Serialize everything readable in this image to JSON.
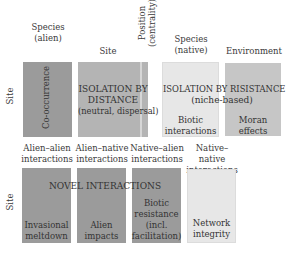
{
  "top_headers": {
    "species_alien": [
      "Species",
      "(alien)"
    ],
    "site": "Site",
    "position": [
      "Position",
      "(centrality)"
    ],
    "species_native": [
      "Species",
      "(native)"
    ],
    "environment": "Environment"
  },
  "row_labels": {
    "top": "Site",
    "bottom": "Site"
  },
  "top_row": {
    "cooccurrence": "Co-occurrence",
    "isolation_distance": [
      "ISOLATION BY",
      "DISTANCE",
      "(neutral, dispersal)"
    ],
    "isolation_resistance": [
      "ISOLATION BY RISISTANCE",
      "(niche-based)"
    ],
    "biotic_interactions": [
      "Biotic",
      "interactions"
    ],
    "moran_effects": [
      "Moran",
      "effects"
    ]
  },
  "bottom_headers": {
    "alien_alien": [
      "Alien–alien",
      "interactions"
    ],
    "alien_native": [
      "Alien–native",
      "interactions"
    ],
    "native_alien": [
      "Native–alien",
      "interactions"
    ],
    "native_native": [
      "Native–native",
      "interactions"
    ]
  },
  "bottom_row": {
    "title": "NOVEL INTERACTIONS",
    "invasional_meltdown": [
      "Invasional",
      "meltdown"
    ],
    "alien_impacts": [
      "Alien",
      "impacts"
    ],
    "biotic_resistance": [
      "Biotic",
      "resistance",
      "(incl.",
      "facilitation)"
    ],
    "network_integrity": [
      "Network",
      "integrity"
    ]
  },
  "colors": {
    "dark": "#9b9b9b",
    "mid": "#b4b4b4",
    "mid2": "#c6c6c6",
    "light": "#e7e7e7"
  }
}
